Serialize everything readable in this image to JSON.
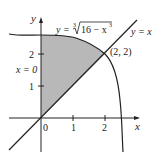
{
  "figure": {
    "curve_label_prefix": "y = ",
    "curve_label_root_index": "3",
    "curve_label_radicand": "16 − x",
    "curve_label_exp": "3",
    "line_label": "y = x",
    "intersection_label": "(2, 2)",
    "boundary_label": "x = 0",
    "axis_x_label": "x",
    "axis_y_label": "y",
    "x_ticks": [
      "0",
      "1",
      "2"
    ],
    "y_ticks": [
      "1",
      "2"
    ],
    "colors": {
      "shade": "#b8b8b8",
      "stroke": "#222222"
    }
  }
}
